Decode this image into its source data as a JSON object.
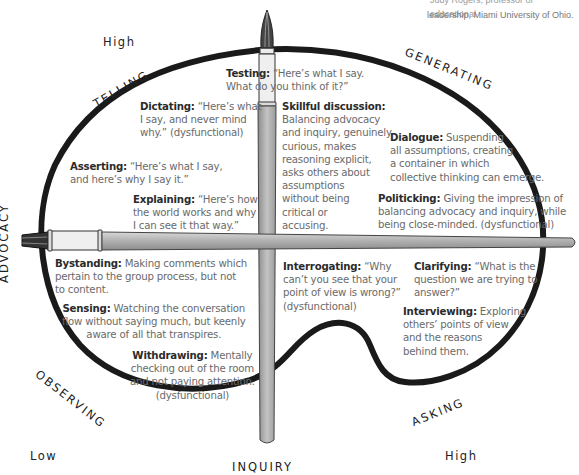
{
  "credit": {
    "line1": "Judy Rogers, professor of educational",
    "line2": "leadership, Miami University of Ohio."
  },
  "axes": {
    "vertical_high": "High",
    "horizontal_low": "Low",
    "horizontal_high": "High",
    "advocacy": "ADVOCACY",
    "inquiry": "INQUIRY"
  },
  "quadrants": {
    "telling": "TELLING",
    "generating": "GENERATING",
    "observing": "OBSERVING",
    "asking": "ASKING"
  },
  "items": {
    "testing": {
      "term": "Testing:",
      "desc1": "“Here’s what I say.",
      "desc2": "What do you think of it?”"
    },
    "dictating": {
      "term": "Dictating:",
      "desc1": "“Here’s what",
      "desc2": "I say, and never mind",
      "desc3": "why.” (dysfunctional)"
    },
    "asserting": {
      "term": "Asserting:",
      "desc1": "“Here’s what I say,",
      "desc2": "and here’s why I say it.”"
    },
    "explaining": {
      "term": "Explaining:",
      "desc1": "“Here’s how",
      "desc2": "the world works and why",
      "desc3": "I can see it that way.”"
    },
    "skillful": {
      "term": "Skillful discussion:",
      "lines": [
        "Balancing advocacy",
        "and inquiry, genuinely",
        "curious, makes",
        "reasoning explicit,",
        "asks others about",
        "assumptions",
        "without being",
        "critical or",
        "accusing."
      ]
    },
    "dialogue": {
      "term": "Dialogue:",
      "desc1": "Suspending",
      "desc2": "all assumptions, creating",
      "desc3": "a container in which",
      "desc4": "collective thinking can emerge."
    },
    "politicking": {
      "term": "Politicking:",
      "desc1": "Giving the impression of",
      "desc2": "balancing advocacy and inquiry, while",
      "desc3": "being close-minded. (dysfunctional)"
    },
    "bystanding": {
      "term": "Bystanding:",
      "desc1": "Making comments which",
      "desc2": "pertain to the group process, but not",
      "desc3": "to content."
    },
    "sensing": {
      "term": "Sensing:",
      "desc1": "Watching the conversation",
      "desc2": "flow without saying much, but keenly",
      "desc3": "aware of all that transpires."
    },
    "withdrawing": {
      "term": "Withdrawing:",
      "desc1": "Mentally",
      "desc2": "checking out of the room",
      "desc3": "and not paying attention.",
      "desc4": "(dysfunctional)"
    },
    "interrogating": {
      "term": "Interrogating:",
      "desc1": "“Why",
      "desc2": "can’t you see that your",
      "desc3": "point of view is wrong?”",
      "desc4": "(dysfunctional)"
    },
    "clarifying": {
      "term": "Clarifying:",
      "desc1": "“What is the",
      "desc2": "question we are trying to",
      "desc3": "answer?”"
    },
    "interviewing": {
      "term": "Interviewing:",
      "desc1": "Exploring",
      "desc2": "others’ points of view",
      "desc3": "and the reasons",
      "desc4": "behind them."
    }
  },
  "colors": {
    "outline": "#1a1a1a",
    "brush_handle": "#b5b5b5",
    "brush_ferrule": "#e6e6e6",
    "text_desc": "#6a6a6a",
    "text_term": "#2b2b2b"
  }
}
